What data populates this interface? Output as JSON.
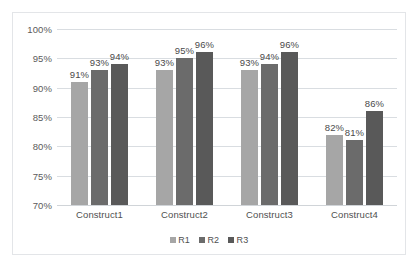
{
  "chart_data": {
    "type": "bar",
    "title": "",
    "subtitle": "",
    "xlabel": "",
    "ylabel": "",
    "categories": [
      "Construct1",
      "Construct2",
      "Construct3",
      "Construct4"
    ],
    "series": [
      {
        "name": "R1",
        "color": "#a6a6a6",
        "values": [
          91,
          93,
          93,
          82
        ],
        "labels": [
          "91%",
          "93%",
          "93%",
          "82%"
        ]
      },
      {
        "name": "R2",
        "color": "#6b6b6b",
        "values": [
          93,
          95,
          94,
          81
        ],
        "labels": [
          "93%",
          "95%",
          "94%",
          "81%"
        ]
      },
      {
        "name": "R3",
        "color": "#595959",
        "values": [
          94,
          96,
          96,
          86
        ],
        "labels": [
          "94%",
          "96%",
          "96%",
          "86%"
        ]
      }
    ],
    "ylim": [
      70,
      100
    ],
    "ytick_step": 5,
    "ytick_labels": [
      "100%",
      "95%",
      "90%",
      "85%",
      "80%",
      "75%",
      "70%"
    ],
    "ytick_values": [
      100,
      95,
      90,
      85,
      80,
      75,
      70
    ],
    "grid": true,
    "grid_axis": "y",
    "legend_position": "bottom",
    "data_labels": true,
    "value_suffix": "%"
  },
  "style": {
    "plot_background": "#ffffff",
    "border_color": "#e3e5e8",
    "gridline_color": "#d9dde1",
    "axis_text_color": "#5b5b5b",
    "label_text_color": "#4a4a4a"
  },
  "legend": {
    "items": [
      {
        "label": "R1",
        "color": "#a6a6a6"
      },
      {
        "label": "R2",
        "color": "#6b6b6b"
      },
      {
        "label": "R3",
        "color": "#595959"
      }
    ]
  }
}
